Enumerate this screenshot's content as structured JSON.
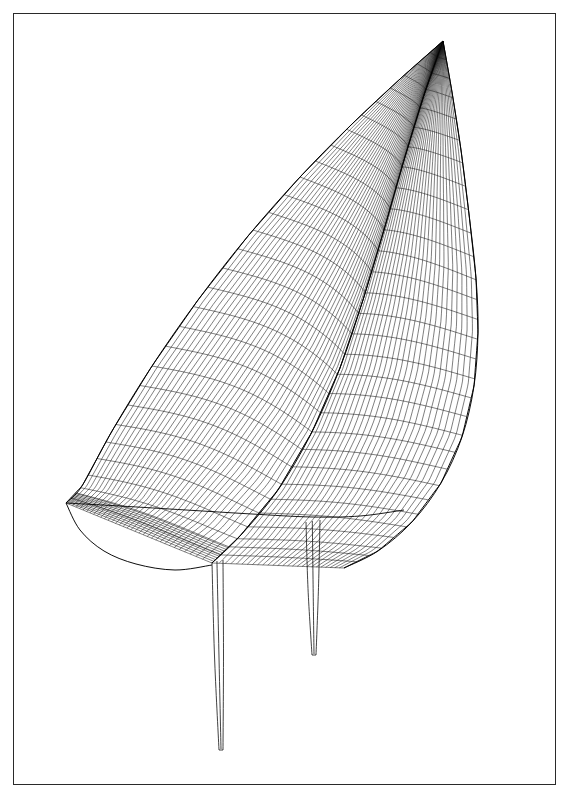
{
  "document": {
    "title": "Yacht Hull Wireframe Perspective View",
    "medium": "technical line drawing",
    "background_color": "#ffffff",
    "line_color": "#141414"
  },
  "frame": {
    "x": 13,
    "y": 13,
    "width": 543,
    "height": 772,
    "stroke_color": "#2a2a2a",
    "stroke_width": 1
  },
  "chart_data": {
    "type": "line",
    "subtitle": "Hull surface mesh with keel fin and rudder fin appendages",
    "xlabel": "",
    "ylabel": "",
    "xlim": [
      0,
      573
    ],
    "ylim": [
      0,
      812
    ],
    "grid": false,
    "legend_position": "none",
    "annotations": [
      "bow stem at upper right",
      "transom / stern at lower left",
      "waterline chine crossing mid hull",
      "two vertical fin appendages below hull"
    ],
    "series": [
      {
        "name": "sheer line (deck edge, port)",
        "points": [
          [
            443,
            41
          ],
          [
            400,
            79
          ],
          [
            352,
            124
          ],
          [
            300,
            177
          ],
          [
            248,
            236
          ],
          [
            198,
            300
          ],
          [
            152,
            366
          ],
          [
            112,
            431
          ],
          [
            82,
            486
          ],
          [
            66,
            503
          ]
        ]
      },
      {
        "name": "keel profile / centreline",
        "points": [
          [
            443,
            41
          ],
          [
            424,
            95
          ],
          [
            404,
            160
          ],
          [
            384,
            230
          ],
          [
            363,
            300
          ],
          [
            340,
            368
          ],
          [
            312,
            432
          ],
          [
            278,
            490
          ],
          [
            240,
            536
          ],
          [
            212,
            563
          ]
        ]
      },
      {
        "name": "bow stem outer edge (starboard silhouette)",
        "points": [
          [
            443,
            41
          ],
          [
            452,
            92
          ],
          [
            461,
            150
          ],
          [
            469,
            214
          ],
          [
            476,
            278
          ],
          [
            478,
            332
          ],
          [
            474,
            386
          ],
          [
            462,
            437
          ],
          [
            441,
            483
          ],
          [
            412,
            522
          ],
          [
            378,
            551
          ],
          [
            344,
            568
          ]
        ]
      },
      {
        "name": "chine / waterline feature",
        "points": [
          [
            66,
            503
          ],
          [
            120,
            506
          ],
          [
            186,
            510
          ],
          [
            252,
            514
          ],
          [
            312,
            517
          ],
          [
            360,
            516
          ],
          [
            404,
            510
          ]
        ]
      },
      {
        "name": "transom bottom edge",
        "points": [
          [
            66,
            503
          ],
          [
            80,
            530
          ],
          [
            104,
            551
          ],
          [
            136,
            564
          ],
          [
            175,
            570
          ],
          [
            212,
            565
          ]
        ]
      }
    ],
    "mesh": {
      "longitudinal_count": 34,
      "transverse_count": 30,
      "description": "surface lattice of waterline curves crossed by station curves"
    },
    "appendages": [
      {
        "name": "rudder-fin",
        "top_x": 212,
        "top_y": 562,
        "bottom_x": 219,
        "bottom_y": 750,
        "chord_top": 11,
        "chord_bottom": 4
      },
      {
        "name": "keel-fin",
        "top_x": 306,
        "top_y": 522,
        "bottom_x": 312,
        "bottom_y": 655,
        "chord_top": 14,
        "chord_bottom": 4
      }
    ]
  }
}
